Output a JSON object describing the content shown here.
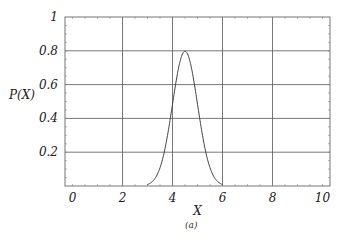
{
  "chart_data": {
    "type": "line",
    "title": "",
    "xlabel": "X",
    "ylabel": "P(X)",
    "caption": "(a)",
    "xlim": [
      -0.3,
      10.3
    ],
    "ylim": [
      0,
      1
    ],
    "grid": true,
    "x_ticks": [
      0,
      2,
      4,
      6,
      8,
      10
    ],
    "x_tick_labels": [
      "0",
      "2",
      "4",
      "6",
      "8",
      "10"
    ],
    "y_ticks": [
      0.2,
      0.4,
      0.6,
      0.8,
      1
    ],
    "y_tick_labels": [
      "0.2",
      "0.4",
      "0.6",
      "0.8",
      "1"
    ],
    "series": [
      {
        "name": "P(X)",
        "kind": "gaussian",
        "mean": 4.5,
        "sigma": 0.5,
        "peak": 0.8,
        "x_range": [
          3.0,
          6.0
        ],
        "color": "#444444",
        "sample_points": [
          {
            "x": 3.0,
            "y": 0.0
          },
          {
            "x": 3.5,
            "y": 0.11
          },
          {
            "x": 4.0,
            "y": 0.48
          },
          {
            "x": 4.5,
            "y": 0.8
          },
          {
            "x": 5.0,
            "y": 0.48
          },
          {
            "x": 5.5,
            "y": 0.11
          },
          {
            "x": 6.0,
            "y": 0.0
          }
        ]
      }
    ]
  }
}
